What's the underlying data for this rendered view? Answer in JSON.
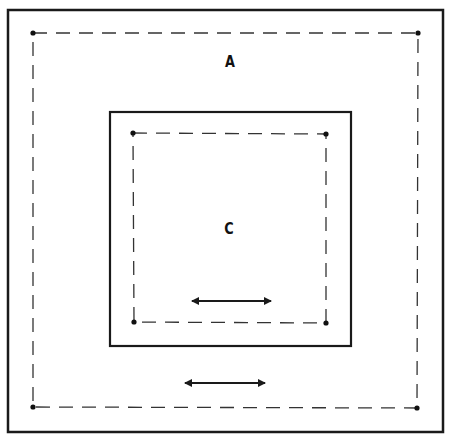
{
  "diagram": {
    "outer_frame": {
      "x": 8,
      "y": 10,
      "w": 435,
      "h": 422
    },
    "region_a": {
      "label": "A",
      "label_pos": {
        "x": 230,
        "y": 61
      },
      "dashed_boundary": {
        "points": [
          [
            33,
            33
          ],
          [
            418,
            33
          ],
          [
            417,
            408
          ],
          [
            33,
            407
          ]
        ]
      }
    },
    "inner_frame": {
      "x": 110,
      "y": 112,
      "w": 241,
      "h": 234
    },
    "region_c": {
      "label": "C",
      "label_pos": {
        "x": 229,
        "y": 228
      },
      "dashed_boundary": {
        "points": [
          [
            133,
            133
          ],
          [
            326,
            134
          ],
          [
            326,
            323
          ],
          [
            134,
            322
          ]
        ]
      }
    },
    "arrows": [
      {
        "name": "inner-double-arrow",
        "x1": 192,
        "x2": 271,
        "y": 301
      },
      {
        "name": "outer-double-arrow",
        "x1": 185,
        "x2": 265,
        "y": 383
      }
    ],
    "colors": {
      "stroke": "#1a1a1a",
      "background": "#ffffff"
    }
  }
}
